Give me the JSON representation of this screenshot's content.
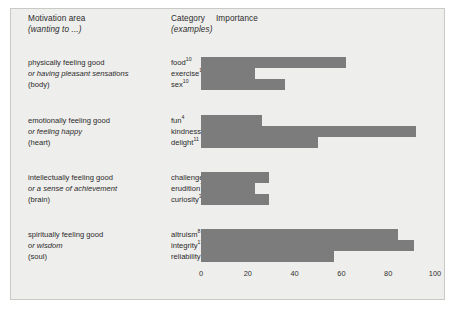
{
  "header": {
    "motivation_title": "Motivation area",
    "motivation_sub": "(wanting to ...)",
    "category_title": "Category",
    "category_sub": "(examples)",
    "importance_title": "Importance"
  },
  "colors": {
    "bar": "#7c7c7c",
    "panel_background": "#eeeeec",
    "panel_border": "#c9c9c5",
    "text": "#2b2b2b"
  },
  "chart_data": {
    "type": "bar",
    "orientation": "horizontal",
    "title": "Importance",
    "xlabel": "",
    "ylabel": "",
    "xlim": [
      0,
      100
    ],
    "xticks": [
      0,
      20,
      40,
      60,
      80,
      100
    ],
    "grid": false,
    "legend": "none",
    "groups": [
      {
        "area_line1": "physically feeling good",
        "area_line2": "or having pleasant sensations",
        "area_line3": "(body)",
        "categories": [
          "food",
          "exercise",
          "sex"
        ],
        "superscripts": [
          "10",
          "10",
          "10"
        ],
        "values": [
          62,
          23,
          36
        ]
      },
      {
        "area_line1": "emotionally feeling good",
        "area_line2": "or feeling happy",
        "area_line3": "(heart)",
        "categories": [
          "fun",
          "kindness",
          "delight"
        ],
        "superscripts": [
          "4",
          "8",
          "11"
        ],
        "values": [
          26,
          92,
          50
        ]
      },
      {
        "area_line1": "intellectually feeling good",
        "area_line2": "or a sense of achievement",
        "area_line3": "(brain)",
        "categories": [
          "challenges",
          "erudition",
          "curiosity"
        ],
        "superscripts": [
          "1",
          "7",
          "3"
        ],
        "values": [
          29,
          23,
          29
        ]
      },
      {
        "area_line1": "spiritually feeling good",
        "area_line2": "or wisdom",
        "area_line3": "(soul)",
        "categories": [
          "altruism",
          "integrity",
          "reliability"
        ],
        "superscripts": [
          "8",
          "17",
          "17"
        ],
        "values": [
          84,
          91,
          57
        ]
      }
    ]
  }
}
